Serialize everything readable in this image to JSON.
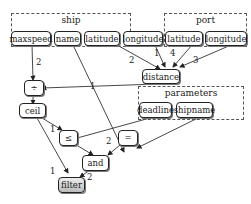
{
  "groups": {
    "ship": "ship",
    "port": "port",
    "parameters": "parameters"
  },
  "nodes": {
    "maxspeed": "maxspeed",
    "name": "name",
    "ship_latitude": "latitude",
    "ship_longitude": "longitude",
    "port_latitude": "latitude",
    "port_longitude": "longitude",
    "distance": "distance",
    "divide": "÷",
    "ceil": "ceil",
    "deadline": "deadline",
    "shipname": "shipname",
    "leq": "≤",
    "eq": "=",
    "and": "and",
    "filter": "filter"
  },
  "edge_labels": {
    "maxspeed_divide": "2",
    "ship_lat_distance": "2",
    "ship_lon_distance": "1",
    "port_lat_distance": "4",
    "port_lon_distance": "3",
    "distance_divide": "1",
    "ceil_leq": "1",
    "deadline_leq": "2",
    "ceil_filter": "1",
    "and_filter": "2"
  }
}
